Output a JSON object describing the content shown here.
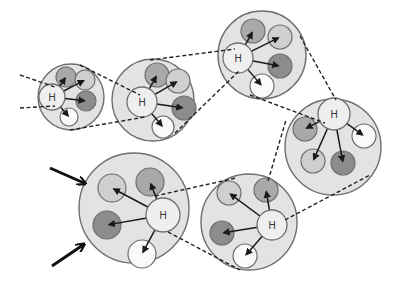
{
  "diagram": {
    "colors": {
      "background": "#ffffff",
      "outer_fill": "#e3e3e3",
      "outline": "#6f6f6f",
      "hub_fill": "#efefef",
      "child_light": "#cfcfcf",
      "child_medium": "#a9a9a9",
      "child_dark": "#8c8c8c",
      "child_white": "#fafafa",
      "arrow": "#1a1a1a"
    },
    "hub_label": "H",
    "groups": [
      {
        "id": "group-1",
        "cx": 71,
        "cy": 97,
        "r": 33,
        "hub": {
          "x": 52,
          "y": 97,
          "r": 13,
          "label": "H"
        },
        "children": [
          {
            "x": 66,
            "y": 77,
            "r": 10,
            "shade": "medium"
          },
          {
            "x": 85,
            "y": 80,
            "r": 10,
            "shade": "light"
          },
          {
            "x": 86,
            "y": 101,
            "r": 10,
            "shade": "dark"
          },
          {
            "x": 69,
            "y": 117,
            "r": 9,
            "shade": "white"
          }
        ]
      },
      {
        "id": "group-2",
        "cx": 153,
        "cy": 100,
        "r": 41,
        "hub": {
          "x": 142,
          "y": 102,
          "r": 15,
          "label": "H"
        },
        "children": [
          {
            "x": 157,
            "y": 75,
            "r": 12,
            "shade": "medium"
          },
          {
            "x": 178,
            "y": 81,
            "r": 12,
            "shade": "light"
          },
          {
            "x": 184,
            "y": 108,
            "r": 12,
            "shade": "dark"
          },
          {
            "x": 163,
            "y": 127,
            "r": 11,
            "shade": "white"
          }
        ]
      },
      {
        "id": "group-3",
        "cx": 262,
        "cy": 55,
        "r": 44,
        "hub": {
          "x": 238,
          "y": 58,
          "r": 15,
          "label": "H"
        },
        "children": [
          {
            "x": 253,
            "y": 31,
            "r": 12,
            "shade": "medium"
          },
          {
            "x": 280,
            "y": 37,
            "r": 12,
            "shade": "light"
          },
          {
            "x": 280,
            "y": 66,
            "r": 12,
            "shade": "dark"
          },
          {
            "x": 262,
            "y": 86,
            "r": 12,
            "shade": "white"
          }
        ]
      },
      {
        "id": "group-4",
        "cx": 333,
        "cy": 147,
        "r": 48,
        "hub": {
          "x": 334,
          "y": 114,
          "r": 16,
          "label": "H"
        },
        "children": [
          {
            "x": 305,
            "y": 129,
            "r": 12,
            "shade": "medium"
          },
          {
            "x": 364,
            "y": 136,
            "r": 12,
            "shade": "white"
          },
          {
            "x": 313,
            "y": 161,
            "r": 12,
            "shade": "light"
          },
          {
            "x": 343,
            "y": 163,
            "r": 12,
            "shade": "dark"
          }
        ]
      },
      {
        "id": "group-5",
        "cx": 249,
        "cy": 222,
        "r": 48,
        "hub": {
          "x": 272,
          "y": 225,
          "r": 15,
          "label": "H"
        },
        "children": [
          {
            "x": 229,
            "y": 193,
            "r": 12,
            "shade": "light"
          },
          {
            "x": 266,
            "y": 190,
            "r": 12,
            "shade": "medium"
          },
          {
            "x": 222,
            "y": 233,
            "r": 12,
            "shade": "dark"
          },
          {
            "x": 245,
            "y": 256,
            "r": 12,
            "shade": "white"
          }
        ]
      },
      {
        "id": "group-6",
        "cx": 134,
        "cy": 208,
        "r": 55,
        "hub": {
          "x": 163,
          "y": 215,
          "r": 17,
          "label": "H"
        },
        "children": [
          {
            "x": 112,
            "y": 188,
            "r": 14,
            "shade": "light"
          },
          {
            "x": 150,
            "y": 182,
            "r": 14,
            "shade": "medium"
          },
          {
            "x": 107,
            "y": 225,
            "r": 14,
            "shade": "dark"
          },
          {
            "x": 142,
            "y": 254,
            "r": 14,
            "shade": "white"
          }
        ]
      }
    ],
    "dashed_connectors": [
      {
        "x1": 20,
        "y1": 75,
        "x2": 55,
        "y2": 87
      },
      {
        "x1": 20,
        "y1": 108,
        "x2": 55,
        "y2": 106
      },
      {
        "x1": 80,
        "y1": 65,
        "x2": 140,
        "y2": 95
      },
      {
        "x1": 70,
        "y1": 130,
        "x2": 145,
        "y2": 117
      },
      {
        "x1": 150,
        "y1": 60,
        "x2": 235,
        "y2": 49
      },
      {
        "x1": 175,
        "y1": 133,
        "x2": 240,
        "y2": 70
      },
      {
        "x1": 300,
        "y1": 36,
        "x2": 336,
        "y2": 100
      },
      {
        "x1": 250,
        "y1": 95,
        "x2": 325,
        "y2": 123
      },
      {
        "x1": 268,
        "y1": 181,
        "x2": 286,
        "y2": 120
      },
      {
        "x1": 285,
        "y1": 220,
        "x2": 370,
        "y2": 175
      },
      {
        "x1": 155,
        "y1": 196,
        "x2": 236,
        "y2": 178
      },
      {
        "x1": 168,
        "y1": 232,
        "x2": 240,
        "y2": 270
      }
    ],
    "input_arrows": [
      {
        "x1": 50,
        "y1": 168,
        "x2": 84,
        "y2": 183
      },
      {
        "x1": 52,
        "y1": 266,
        "x2": 83,
        "y2": 245
      }
    ]
  }
}
